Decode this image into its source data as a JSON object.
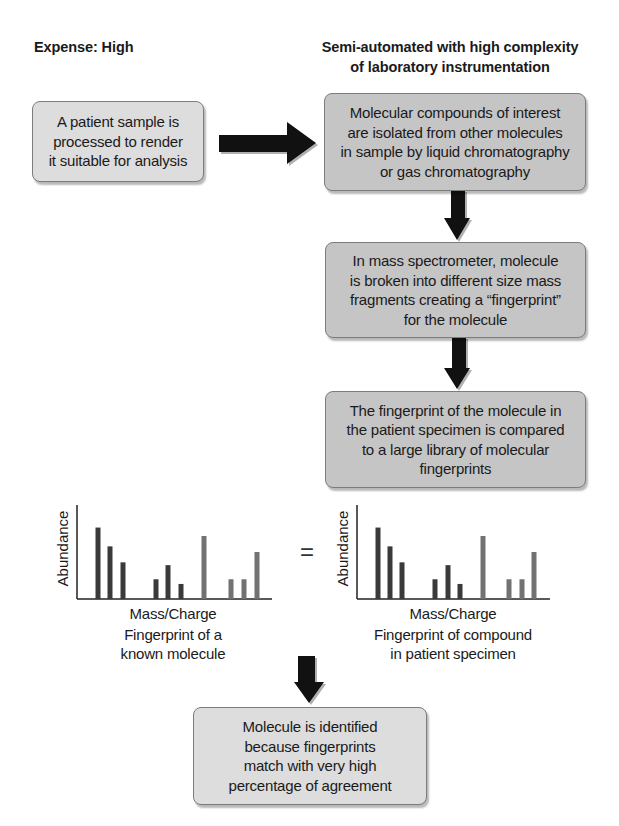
{
  "headings": {
    "left": "Expense: High",
    "right": "Semi-automated with high complexity\nof laboratory instrumentation"
  },
  "steps": [
    {
      "id": "sample-processing",
      "text": "A patient sample is\nprocessed to render\nit suitable for analysis"
    },
    {
      "id": "chromatography",
      "text": "Molecular compounds of interest\nare isolated from other molecules\nin sample by liquid chromatography\nor gas chromatography"
    },
    {
      "id": "mass-spectrometry",
      "text": "In mass spectrometer, molecule\nis broken into different size mass\nfragments creating a “fingerprint”\nfor the molecule"
    },
    {
      "id": "library-comparison",
      "text": "The fingerprint of the molecule in\nthe patient specimen is compared\nto a large library of molecular\nfingerprints"
    },
    {
      "id": "identification",
      "text": "Molecule is identified\nbecause fingerprints\nmatch with very high\npercentage of agreement"
    }
  ],
  "equals_sign": "=",
  "colors": {
    "box_light": "#dddddd",
    "box_dark": "#c5c5c5",
    "arrow": "#111111",
    "bar_dark": "#3a3a3a",
    "bar_gray": "#727272",
    "axis": "#222222"
  },
  "chart_data": [
    {
      "type": "bar",
      "title": "",
      "caption": "Fingerprint of a\nknown molecule",
      "xlabel": "Mass/Charge",
      "ylabel": "Abundance",
      "grid": false,
      "legend": null,
      "x": [
        21,
        33,
        46,
        79,
        91,
        104,
        127,
        154,
        167,
        180
      ],
      "values": [
        76,
        56,
        39,
        21,
        36,
        16,
        67,
        21,
        21,
        50
      ],
      "bar_shade": [
        "dark",
        "dark",
        "dark",
        "dark",
        "dark",
        "dark",
        "gray",
        "gray",
        "gray",
        "gray"
      ],
      "ylim": [
        0,
        100
      ],
      "xlim": [
        0,
        195
      ]
    },
    {
      "type": "bar",
      "title": "",
      "caption": "Fingerprint of compound\nin patient specimen",
      "xlabel": "Mass/Charge",
      "ylabel": "Abundance",
      "grid": false,
      "legend": null,
      "x": [
        21,
        33,
        45,
        78,
        91,
        103,
        126,
        152,
        165,
        177
      ],
      "values": [
        76,
        56,
        39,
        21,
        36,
        16,
        67,
        21,
        21,
        50
      ],
      "bar_shade": [
        "dark",
        "dark",
        "dark",
        "dark",
        "dark",
        "dark",
        "gray",
        "gray",
        "gray",
        "gray"
      ],
      "ylim": [
        0,
        100
      ],
      "xlim": [
        0,
        193
      ]
    }
  ]
}
